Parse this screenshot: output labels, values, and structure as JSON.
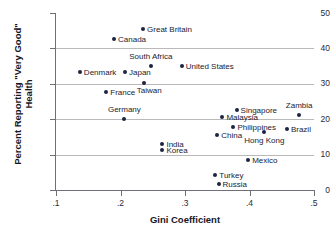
{
  "chart_data": {
    "type": "scatter",
    "title": "",
    "xlabel": "Gini Coefficient",
    "ylabel": "Percent Reporting \"Very Good\" Health",
    "xlim": [
      0.1,
      0.5
    ],
    "ylim": [
      0,
      50
    ],
    "xticks": [
      ".1",
      ".2",
      ".3",
      ".4",
      ".5"
    ],
    "xtick_values": [
      0.1,
      0.2,
      0.3,
      0.4,
      0.5
    ],
    "yticks": [
      "0",
      "10",
      "20",
      "30",
      "40",
      "50"
    ],
    "ytick_values": [
      0,
      10,
      20,
      30,
      40,
      50
    ],
    "grid": "horizontal",
    "legend": "none",
    "marker_color": "#1d2440",
    "points": [
      {
        "label": "Great Britain",
        "x": 0.235,
        "y": 45.5,
        "lp": "right"
      },
      {
        "label": "Canada",
        "x": 0.19,
        "y": 42.7,
        "lp": "right"
      },
      {
        "label": "South Africa",
        "x": 0.247,
        "y": 35.0,
        "lp": "above"
      },
      {
        "label": "United States",
        "x": 0.295,
        "y": 34.9,
        "lp": "right"
      },
      {
        "label": "Denmark",
        "x": 0.137,
        "y": 33.2,
        "lp": "right"
      },
      {
        "label": "Japan",
        "x": 0.207,
        "y": 33.2,
        "lp": "right"
      },
      {
        "label": "Taiwan",
        "x": 0.236,
        "y": 30.1,
        "lp": "br"
      },
      {
        "label": "France",
        "x": 0.178,
        "y": 27.6,
        "lp": "right"
      },
      {
        "label": "Singapore",
        "x": 0.38,
        "y": 22.6,
        "lp": "right"
      },
      {
        "label": "Zambia",
        "x": 0.477,
        "y": 21.1,
        "lp": "above"
      },
      {
        "label": "Malaysia",
        "x": 0.358,
        "y": 20.5,
        "lp": "right"
      },
      {
        "label": "Germany",
        "x": 0.206,
        "y": 20.0,
        "lp": "above"
      },
      {
        "label": "Philippines",
        "x": 0.375,
        "y": 17.9,
        "lp": "right"
      },
      {
        "label": "Brazil",
        "x": 0.458,
        "y": 17.2,
        "lp": "right"
      },
      {
        "label": "Hong Kong",
        "x": 0.423,
        "y": 16.5,
        "lp": "below"
      },
      {
        "label": "China",
        "x": 0.35,
        "y": 15.6,
        "lp": "right"
      },
      {
        "label": "India",
        "x": 0.265,
        "y": 13.1,
        "lp": "right"
      },
      {
        "label": "Korea",
        "x": 0.265,
        "y": 11.2,
        "lp": "right"
      },
      {
        "label": "Mexico",
        "x": 0.398,
        "y": 8.4,
        "lp": "right"
      },
      {
        "label": "Turkey",
        "x": 0.347,
        "y": 4.2,
        "lp": "right"
      },
      {
        "label": "Russia",
        "x": 0.352,
        "y": 1.6,
        "lp": "right"
      }
    ]
  }
}
